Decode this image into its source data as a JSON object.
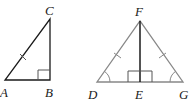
{
  "figure": {
    "triangle_left": {
      "vertices": {
        "A": "A",
        "B": "B",
        "C": "C"
      },
      "right_angle_at": "B",
      "tick_marks": [
        "AC"
      ],
      "color": "#1a1a1a"
    },
    "triangle_right": {
      "vertices": {
        "D": "D",
        "E": "E",
        "F": "F",
        "G": "G"
      },
      "right_angles_at": "E",
      "tick_marks": [
        "DF",
        "FG"
      ],
      "angle_arcs": [
        "D",
        "G"
      ],
      "outline_color": "#888888",
      "altitude_color": "#1a1a1a"
    }
  }
}
